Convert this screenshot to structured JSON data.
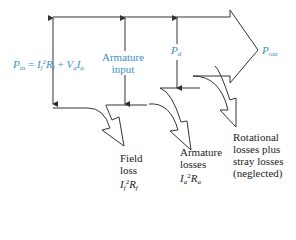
{
  "diagram": {
    "colors": {
      "line": "#333333",
      "label_blue": "#3a8fc4",
      "text": "#222222"
    },
    "labels": {
      "p_in": {
        "symbol": "P",
        "sub": "in",
        "eq": " = ",
        "t1": "I",
        "t1sub": "f",
        "t1sup": "2",
        "t1b": "R",
        "t1bsub": "f",
        "plus": " + ",
        "t2a": "V",
        "t2asub": "a",
        "t2b": "I",
        "t2bsub": "a"
      },
      "armature_input": {
        "line1": "Armature",
        "line2": "input"
      },
      "p_d": {
        "symbol": "P",
        "sub": "d"
      },
      "p_out": {
        "symbol": "P",
        "sub": "out"
      },
      "field_loss": {
        "line1": "Field",
        "line2": "loss",
        "f_I": "I",
        "f_Isub": "f",
        "f_sup": "2",
        "f_R": "R",
        "f_Rsub": "f"
      },
      "armature_losses": {
        "line1": "Armature",
        "line2": "losses",
        "f_I": "I",
        "f_Isub": "a",
        "f_sup": "2",
        "f_R": "R",
        "f_Rsub": "a"
      },
      "rotational_losses": {
        "line1": "Rotational",
        "line2": "losses plus",
        "line3": "stray losses",
        "line4": "(neglected)"
      }
    }
  }
}
